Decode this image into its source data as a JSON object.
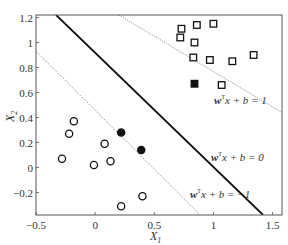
{
  "chart_data": {
    "type": "scatter",
    "title": "",
    "xlabel": "X1",
    "ylabel": "X2",
    "xlim": [
      -0.5,
      1.58
    ],
    "ylim": [
      -0.38,
      1.22
    ],
    "x_ticks": [
      -0.5,
      0,
      0.5,
      1,
      1.5
    ],
    "x_tick_labels": [
      "−0.5",
      "0",
      "0.5",
      "1",
      "1.5"
    ],
    "y_ticks": [
      -0.2,
      0,
      0.2,
      0.4,
      0.6,
      0.8,
      1,
      1.2
    ],
    "y_tick_labels": [
      "−0.2",
      "0",
      "0.2",
      "0.4",
      "0.6",
      "0.8",
      "1",
      "1.2"
    ],
    "grid": false,
    "series": [
      {
        "name": "class +1 (squares)",
        "marker": "square-open",
        "points": [
          [
            0.73,
            1.11
          ],
          [
            0.86,
            1.14
          ],
          [
            1.0,
            1.15
          ],
          [
            0.72,
            1.04
          ],
          [
            0.84,
            1.0
          ],
          [
            0.83,
            0.88
          ],
          [
            0.97,
            0.86
          ],
          [
            1.16,
            0.85
          ],
          [
            1.34,
            0.9
          ],
          [
            1.07,
            0.66
          ]
        ]
      },
      {
        "name": "class +1 support vectors",
        "marker": "square-filled",
        "points": [
          [
            0.84,
            0.67
          ]
        ]
      },
      {
        "name": "class -1 (circles)",
        "marker": "circle-open",
        "points": [
          [
            -0.18,
            0.37
          ],
          [
            -0.22,
            0.27
          ],
          [
            -0.28,
            0.07
          ],
          [
            0.08,
            0.19
          ],
          [
            -0.01,
            0.02
          ],
          [
            0.13,
            0.05
          ],
          [
            0.4,
            -0.23
          ],
          [
            0.22,
            -0.31
          ]
        ]
      },
      {
        "name": "class -1 support vectors",
        "marker": "circle-filled",
        "points": [
          [
            0.22,
            0.28
          ],
          [
            0.39,
            0.14
          ]
        ]
      }
    ],
    "lines": [
      {
        "name": "decision boundary",
        "label": "wᵀx + b = 0",
        "style": "solid",
        "from": [
          -0.33,
          1.22
        ],
        "to": [
          1.42,
          -0.38
        ]
      },
      {
        "name": "positive margin",
        "label": "wᵀx + b = 1",
        "style": "dotted",
        "from": [
          0.2,
          1.22
        ],
        "to": [
          1.58,
          0.44
        ]
      },
      {
        "name": "negative margin",
        "label": "wᵀx + b = −1",
        "style": "dotted",
        "from": [
          -0.5,
          0.93
        ],
        "to": [
          0.89,
          -0.38
        ]
      }
    ],
    "annotations": [
      {
        "text": "wᵀx + b = 1",
        "x": 1.3,
        "y": 0.53
      },
      {
        "text": "wᵀx + b = 0",
        "x": 1.2,
        "y": 0.25
      },
      {
        "text": "wᵀx + b = −1",
        "x": 0.92,
        "y": -0.1
      }
    ]
  },
  "labels": {
    "x_axis": "X",
    "x_axis_sub": "1",
    "y_axis": "X",
    "y_axis_sub": "2",
    "ann_pos": {
      "w": "w",
      "sup": "T",
      "rest": "x + b = 1"
    },
    "ann_zero": {
      "w": "w",
      "sup": "T",
      "rest": "x + b = 0"
    },
    "ann_neg": {
      "w": "w",
      "sup": "T",
      "rest": "x + b = −1"
    }
  },
  "colors": {
    "axis": "#555555",
    "boundary": "#111111",
    "margin": "#777777",
    "marker": "#111111"
  }
}
